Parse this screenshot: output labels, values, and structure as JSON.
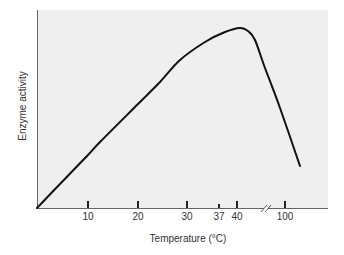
{
  "chart_data": {
    "type": "line",
    "title": "",
    "xlabel": "Temperature (°C)",
    "ylabel": "Enzyme activity",
    "x_ticks": [
      {
        "label": "10",
        "value": 10,
        "px": 88,
        "major": true
      },
      {
        "label": "20",
        "value": 20,
        "px": 138,
        "major": true
      },
      {
        "label": "30",
        "value": 30,
        "px": 187,
        "major": true
      },
      {
        "label": "37",
        "value": 37,
        "px": 219,
        "major": false
      },
      {
        "label": "40",
        "value": 40,
        "px": 237,
        "major": true
      },
      {
        "label": "100",
        "value": 100,
        "px": 285,
        "major": true
      }
    ],
    "axis_break": {
      "between": [
        40,
        100
      ],
      "px": 266,
      "symbol": "//"
    },
    "y_ticks": [],
    "grid": false,
    "legend": null,
    "series": [
      {
        "name": "Enzyme activity",
        "color": "#111111",
        "points_px": [
          [
            37,
            208
          ],
          [
            60,
            184
          ],
          [
            88,
            155
          ],
          [
            100,
            142
          ],
          [
            138,
            104
          ],
          [
            160,
            82
          ],
          [
            180,
            60
          ],
          [
            205,
            42
          ],
          [
            225,
            32
          ],
          [
            240,
            28
          ],
          [
            248,
            31
          ],
          [
            255,
            40
          ],
          [
            265,
            68
          ],
          [
            280,
            108
          ],
          [
            300,
            166
          ]
        ],
        "description": "Activity rises roughly linearly from 0 at 0°C, peaks near 40°C, then falls sharply at higher temperatures"
      }
    ],
    "plot_area": {
      "left": 37,
      "top": 10,
      "right": 328,
      "bottom": 208
    },
    "colors": {
      "plot_background": "#efefef",
      "axis": "#555555",
      "curve": "#111111",
      "text": "#333333"
    }
  }
}
